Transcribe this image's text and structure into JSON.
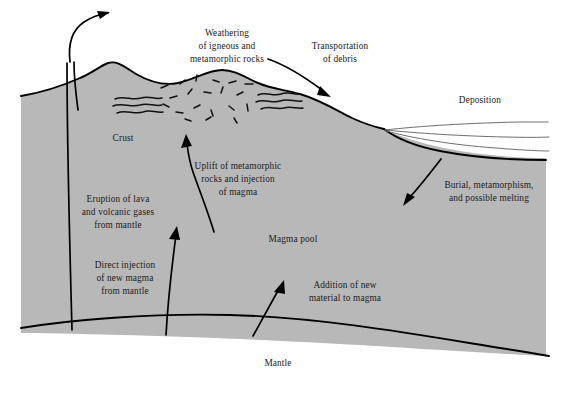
{
  "figure": {
    "background_color": "#ffffff",
    "crust_fill_color": "#b8b8b8",
    "line_color": "#000000",
    "text_color": "#1a1a1a",
    "width": 566,
    "height": 405
  },
  "labels": {
    "weathering": {
      "line1": "Weathering",
      "line2": "of igneous and",
      "line3": "metamorphic rocks"
    },
    "transportation": {
      "line1": "Transportation",
      "line2": "of debris"
    },
    "deposition": {
      "line1": "Deposition"
    },
    "burial": {
      "line1": "Burial, metamorphism,",
      "line2": "and possible melting"
    },
    "crust": {
      "line1": "Crust"
    },
    "uplift": {
      "line1": "Uplift of metamorphic",
      "line2": "rocks and injection",
      "line3": "of magma"
    },
    "eruption": {
      "line1": "Eruption of lava",
      "line2": "and volcanic gases",
      "line3": "from mantle"
    },
    "direct_injection": {
      "line1": "Direct injection",
      "line2": "of new magma",
      "line3": "from mantle"
    },
    "magma_pool": {
      "line1": "Magma pool"
    },
    "addition": {
      "line1": "Addition of new",
      "line2": "material to magma"
    },
    "mantle": {
      "line1": "Mantle"
    }
  },
  "arrows": [
    {
      "name": "eruption-arrow",
      "description": "curves up and out of volcanic fissure to upper left sky"
    },
    {
      "name": "transportation-arrow",
      "description": "curves down-right from weathering peak toward shoreline"
    },
    {
      "name": "burial-arrow",
      "description": "curves down-left from sediment basin into crust"
    },
    {
      "name": "uplift-arrow",
      "description": "curves up from magma pool into metamorphic rock zone"
    },
    {
      "name": "direct-injection-arrow",
      "description": "straight up from mantle through crust"
    },
    {
      "name": "addition-arrow",
      "description": "short diagonal up-left from mantle into magma pool"
    }
  ]
}
